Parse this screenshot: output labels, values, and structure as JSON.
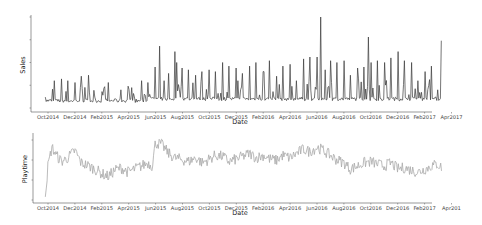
{
  "chart_data": [
    {
      "type": "line",
      "title": "",
      "xlabel": "Date",
      "ylabel": "Sales",
      "color": "#3a3a3a",
      "grid": false,
      "x_ticks": [
        "Oct2014",
        "Dec2014",
        "Feb2015",
        "Apr2015",
        "Jun2015",
        "Aug2015",
        "Oct2015",
        "Dec2015",
        "Feb2016",
        "Apr2016",
        "Jun2016",
        "Aug2016",
        "Oct2016",
        "Dec2016",
        "Feb2017",
        "Apr2017"
      ],
      "x_range": [
        "2014-09",
        "2017-04"
      ],
      "y_ticks_labeled": false,
      "ylim_relative": [
        0,
        1
      ],
      "description": "Daily sales with a low baseline (~0.05-0.15 relative) and frequent weekly spikes; spikes grow over time, peaking at ~1.0 near Jun2016, ~0.68 near Jun2015, ~0.78 near Oct2016, ~0.74 near Mar2017.",
      "series": [
        {
          "name": "Sales",
          "x": [
            "2014-09-25",
            "2014-10-15",
            "2014-11-01",
            "2014-11-15",
            "2014-12-01",
            "2014-12-15",
            "2015-01-01",
            "2015-01-15",
            "2015-02-01",
            "2015-02-15",
            "2015-03-01",
            "2015-03-15",
            "2015-04-01",
            "2015-04-15",
            "2015-05-01",
            "2015-05-15",
            "2015-06-01",
            "2015-06-10",
            "2015-06-20",
            "2015-07-01",
            "2015-07-15",
            "2015-07-20",
            "2015-08-01",
            "2015-08-15",
            "2015-09-01",
            "2015-09-15",
            "2015-10-01",
            "2015-10-15",
            "2015-11-01",
            "2015-11-15",
            "2015-12-01",
            "2015-12-15",
            "2016-01-01",
            "2016-01-15",
            "2016-02-01",
            "2016-02-15",
            "2016-03-01",
            "2016-03-15",
            "2016-04-01",
            "2016-04-15",
            "2016-05-01",
            "2016-05-15",
            "2016-06-01",
            "2016-06-10",
            "2016-06-20",
            "2016-07-01",
            "2016-07-15",
            "2016-08-01",
            "2016-08-15",
            "2016-09-01",
            "2016-09-15",
            "2016-09-25",
            "2016-10-01",
            "2016-10-15",
            "2016-11-01",
            "2016-11-15",
            "2016-12-01",
            "2016-12-15",
            "2017-01-01",
            "2017-01-15",
            "2017-02-01",
            "2017-02-15",
            "2017-03-01",
            "2017-03-10"
          ],
          "peak_values_relative": [
            0.12,
            0.3,
            0.32,
            0.3,
            0.28,
            0.35,
            0.36,
            0.12,
            0.18,
            0.28,
            0.1,
            0.2,
            0.24,
            0.12,
            0.3,
            0.28,
            0.45,
            0.68,
            0.3,
            0.38,
            0.62,
            0.5,
            0.44,
            0.42,
            0.36,
            0.4,
            0.42,
            0.4,
            0.5,
            0.46,
            0.44,
            0.38,
            0.46,
            0.5,
            0.4,
            0.52,
            0.35,
            0.46,
            0.48,
            0.3,
            0.54,
            0.56,
            0.56,
            1.0,
            0.42,
            0.52,
            0.5,
            0.52,
            0.36,
            0.44,
            0.45,
            0.78,
            0.5,
            0.52,
            0.5,
            0.55,
            0.62,
            0.52,
            0.5,
            0.3,
            0.4,
            0.46,
            0.2,
            0.74
          ]
        }
      ]
    },
    {
      "type": "line",
      "title": "",
      "xlabel": "Date",
      "ylabel": "Playtime",
      "color": "#aaaaaa",
      "grid": false,
      "x_ticks": [
        "Oct2014",
        "Dec2014",
        "Feb2015",
        "Apr2015",
        "Jun2015",
        "Aug2015",
        "Oct2015",
        "Dec2015",
        "Feb2016",
        "Apr2016",
        "Jun2016",
        "Aug2016",
        "Oct2016",
        "Dec2016",
        "Feb2017",
        "Apr201"
      ],
      "x_range": [
        "2014-09",
        "2017-04"
      ],
      "y_ticks_labeled": false,
      "ylim_relative": [
        0,
        1
      ],
      "description": "Daily playtime: starts near 0 at late Sep 2014, jumps to ~0.85 in Oct 2014, dips to ~0.35 in Feb 2015, jumps to ~0.95 at Jun 2015, then fluctuates around 0.55-0.8, with a slight decline to ~0.4-0.55 in late 2016 - early 2017.",
      "series": [
        {
          "name": "Playtime",
          "x": [
            "2014-09-25",
            "2014-10-01",
            "2014-10-10",
            "2014-10-20",
            "2014-11-01",
            "2014-11-15",
            "2014-12-01",
            "2014-12-15",
            "2015-01-01",
            "2015-01-15",
            "2015-02-01",
            "2015-02-15",
            "2015-03-01",
            "2015-03-15",
            "2015-04-01",
            "2015-04-15",
            "2015-05-01",
            "2015-05-15",
            "2015-05-25",
            "2015-06-01",
            "2015-06-15",
            "2015-07-01",
            "2015-07-15",
            "2015-08-01",
            "2015-08-15",
            "2015-09-01",
            "2015-09-15",
            "2015-10-01",
            "2015-10-15",
            "2015-11-01",
            "2015-11-15",
            "2015-12-01",
            "2015-12-15",
            "2016-01-01",
            "2016-01-15",
            "2016-02-01",
            "2016-02-15",
            "2016-03-01",
            "2016-03-15",
            "2016-04-01",
            "2016-04-15",
            "2016-05-01",
            "2016-05-15",
            "2016-06-01",
            "2016-06-15",
            "2016-07-01",
            "2016-07-15",
            "2016-08-01",
            "2016-08-15",
            "2016-09-01",
            "2016-09-15",
            "2016-10-01",
            "2016-10-15",
            "2016-11-01",
            "2016-11-15",
            "2016-12-01",
            "2016-12-15",
            "2017-01-01",
            "2017-01-15",
            "2017-02-01",
            "2017-02-15",
            "2017-03-01",
            "2017-03-10"
          ],
          "values_relative": [
            0.05,
            0.55,
            0.85,
            0.72,
            0.62,
            0.68,
            0.8,
            0.6,
            0.55,
            0.5,
            0.42,
            0.38,
            0.48,
            0.52,
            0.45,
            0.5,
            0.55,
            0.6,
            0.55,
            0.92,
            0.9,
            0.75,
            0.68,
            0.65,
            0.62,
            0.68,
            0.6,
            0.66,
            0.72,
            0.7,
            0.62,
            0.66,
            0.7,
            0.75,
            0.68,
            0.72,
            0.66,
            0.64,
            0.72,
            0.68,
            0.75,
            0.82,
            0.78,
            0.85,
            0.8,
            0.72,
            0.65,
            0.6,
            0.5,
            0.55,
            0.6,
            0.62,
            0.58,
            0.55,
            0.6,
            0.5,
            0.52,
            0.48,
            0.45,
            0.5,
            0.55,
            0.58,
            0.52
          ]
        }
      ]
    }
  ],
  "top_chart": {
    "ylabel": "Sales",
    "xlabel": "Date",
    "x_ticks": [
      "Oct2014",
      "Dec2014",
      "Feb2015",
      "Apr2015",
      "Jun2015",
      "Aug2015",
      "Oct2015",
      "Dec2015",
      "Feb2016",
      "Apr2016",
      "Jun2016",
      "Aug2016",
      "Oct2016",
      "Dec2016",
      "Feb2017",
      "Apr2017"
    ]
  },
  "bottom_chart": {
    "ylabel": "Playtime",
    "xlabel": "Date",
    "x_ticks": [
      "Oct2014",
      "Dec2014",
      "Feb2015",
      "Apr2015",
      "Jun2015",
      "Aug2015",
      "Oct2015",
      "Dec2015",
      "Feb2016",
      "Apr2016",
      "Jun2016",
      "Aug2016",
      "Oct2016",
      "Dec2016",
      "Feb2017",
      "Apr201"
    ]
  }
}
